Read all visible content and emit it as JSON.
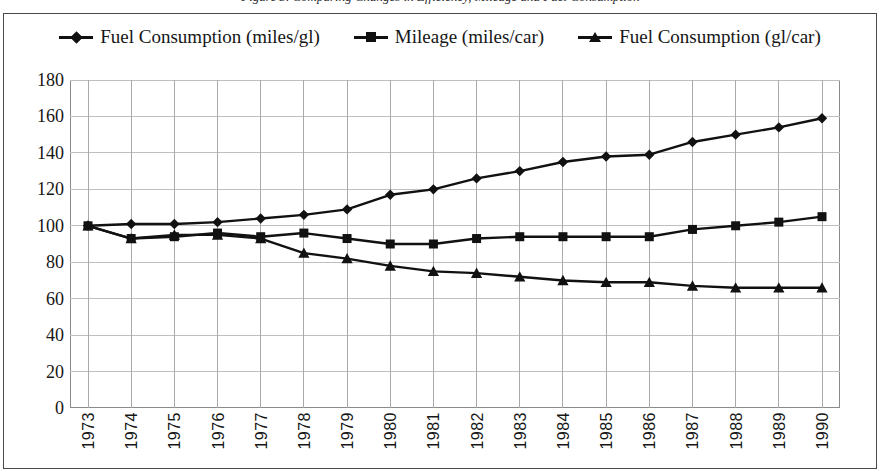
{
  "title": {
    "text": "Figure 3. Comparing Changes in Efficiency, Mileage and Fuel Consumption",
    "clipped": true
  },
  "legend": {
    "position": "top",
    "items": [
      {
        "label": "Fuel Consumption (miles/gl)",
        "marker": "diamond-marker",
        "color": "#111111"
      },
      {
        "label": "Mileage (miles/car)",
        "marker": "square-marker",
        "color": "#111111"
      },
      {
        "label": "Fuel Consumption (gl/car)",
        "marker": "triangle-marker",
        "color": "#111111"
      }
    ]
  },
  "axes": {
    "y": {
      "label": "",
      "min": 0,
      "max": 180,
      "step": 20,
      "ticks": [
        "0",
        "20",
        "40",
        "60",
        "80",
        "100",
        "120",
        "140",
        "160",
        "180"
      ]
    },
    "x": {
      "label": "",
      "ticks": [
        "1973",
        "1974",
        "1975",
        "1976",
        "1977",
        "1978",
        "1979",
        "1980",
        "1981",
        "1982",
        "1983",
        "1984",
        "1985",
        "1986",
        "1987",
        "1988",
        "1989",
        "1990"
      ]
    },
    "grid": true,
    "grid_color": "#bfbfbf"
  },
  "chart_data": {
    "type": "line",
    "title": "Figure 3. Comparing Changes in Efficiency, Mileage and Fuel Consumption",
    "xlabel": "",
    "ylabel": "",
    "ylim": [
      0,
      180
    ],
    "grid": true,
    "legend_position": "top",
    "categories": [
      "1973",
      "1974",
      "1975",
      "1976",
      "1977",
      "1978",
      "1979",
      "1980",
      "1981",
      "1982",
      "1983",
      "1984",
      "1985",
      "1986",
      "1987",
      "1988",
      "1989",
      "1990"
    ],
    "series": [
      {
        "name": "Fuel Consumption (miles/gl)",
        "marker": "diamond",
        "color": "#111111",
        "values": [
          100,
          101,
          101,
          102,
          104,
          106,
          109,
          117,
          120,
          126,
          130,
          135,
          138,
          139,
          146,
          150,
          154,
          159
        ]
      },
      {
        "name": "Mileage (miles/car)",
        "marker": "square",
        "color": "#111111",
        "values": [
          100,
          93,
          94,
          96,
          94,
          96,
          93,
          90,
          90,
          93,
          94,
          94,
          94,
          94,
          98,
          100,
          102,
          105
        ]
      },
      {
        "name": "Fuel Consumption (gl/car)",
        "marker": "triangle",
        "color": "#111111",
        "values": [
          100,
          93,
          95,
          95,
          93,
          85,
          82,
          78,
          75,
          74,
          72,
          70,
          69,
          69,
          67,
          66,
          66,
          66
        ]
      }
    ]
  }
}
